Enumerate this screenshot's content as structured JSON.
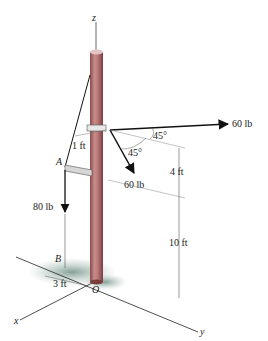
{
  "diagram": {
    "type": "3D statics free-body figure",
    "axes": {
      "x": "x",
      "y": "y",
      "z": "z"
    },
    "points": {
      "A": "A",
      "B": "B",
      "O": "O"
    },
    "forces": [
      {
        "label": "60 lb",
        "direction": "horizontal right (along y)",
        "angle": "45°"
      },
      {
        "label": "60 lb",
        "direction": "down-right",
        "angle": "45°"
      },
      {
        "label": "80 lb",
        "direction": "down",
        "at": "A"
      }
    ],
    "angles": [
      "45°",
      "45°"
    ],
    "dimensions": {
      "bracket": "1 ft",
      "upper": "4 ft",
      "lower": "10 ft",
      "base": "3 ft"
    },
    "colors": {
      "pole": "#b87878",
      "pole_dark": "#8a4a4a",
      "shadow": "#8aa59a",
      "line": "#111111"
    }
  }
}
